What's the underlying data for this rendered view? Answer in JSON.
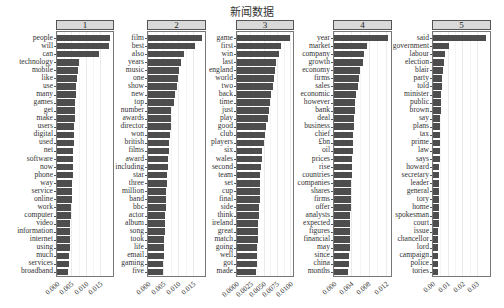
{
  "title": "新闻数据",
  "chart_data": {
    "type": "bar",
    "orientation": "horizontal",
    "title": "新闻数据",
    "xlabel": "",
    "ylabel": "",
    "facets": [
      {
        "label": "1",
        "xlim": [
          0,
          0.0195
        ],
        "ticks": [
          0,
          0.005,
          0.01,
          0.015
        ],
        "tick_labels": [
          "0.000",
          "0.005",
          "0.010",
          "0.015"
        ],
        "terms": [
          "people",
          "will",
          "can",
          "technology",
          "mobile",
          "like",
          "use",
          "many",
          "games",
          "get",
          "make",
          "users",
          "digital",
          "used",
          "net",
          "software",
          "now",
          "phone",
          "way",
          "service",
          "online",
          "work",
          "computer",
          "video",
          "information",
          "internet",
          "using",
          "much",
          "services",
          "broadband"
        ],
        "values": [
          0.0185,
          0.018,
          0.0146,
          0.0077,
          0.0073,
          0.007,
          0.0067,
          0.0066,
          0.0063,
          0.0062,
          0.0061,
          0.006,
          0.0059,
          0.0058,
          0.0057,
          0.0056,
          0.0055,
          0.0054,
          0.0053,
          0.0052,
          0.0051,
          0.0049,
          0.0048,
          0.0047,
          0.0046,
          0.0045,
          0.0044,
          0.0042,
          0.0041,
          0.004
        ]
      },
      {
        "label": "2",
        "xlim": [
          0,
          0.019
        ],
        "ticks": [
          0,
          0.005,
          0.01,
          0.015
        ],
        "tick_labels": [
          "0.000",
          "0.005",
          "0.010",
          "0.015"
        ],
        "terms": [
          "film",
          "best",
          "also",
          "years",
          "music",
          "one",
          "show",
          "new",
          "top",
          "number",
          "awards",
          "director",
          "won",
          "british",
          "films",
          "award",
          "including",
          "star",
          "three",
          "million",
          "band",
          "bbc",
          "actor",
          "album",
          "song",
          "took",
          "life",
          "email",
          "gaming",
          "five"
        ],
        "values": [
          0.018,
          0.0157,
          0.0121,
          0.0111,
          0.0103,
          0.0099,
          0.0097,
          0.0091,
          0.0087,
          0.0078,
          0.0077,
          0.0075,
          0.0072,
          0.0071,
          0.0069,
          0.0068,
          0.0066,
          0.0064,
          0.0063,
          0.0061,
          0.006,
          0.0059,
          0.0058,
          0.0056,
          0.0055,
          0.0054,
          0.0053,
          0.0052,
          0.0051,
          0.005
        ]
      },
      {
        "label": "3",
        "xlim": [
          0,
          0.0105
        ],
        "ticks": [
          0,
          0.0025,
          0.005,
          0.0075,
          0.01
        ],
        "tick_labels": [
          "0.0000",
          "0.0025",
          "0.0050",
          "0.0075",
          "0.0100"
        ],
        "terms": [
          "game",
          "first",
          "win",
          "last",
          "england",
          "world",
          "two",
          "back",
          "time",
          "just",
          "play",
          "good",
          "club",
          "players",
          "six",
          "wales",
          "second",
          "team",
          "set",
          "cup",
          "final",
          "side",
          "think",
          "ireland",
          "great",
          "match",
          "going",
          "well",
          "got",
          "made"
        ],
        "values": [
          0.01,
          0.0082,
          0.0078,
          0.0074,
          0.0072,
          0.007,
          0.0067,
          0.0063,
          0.0062,
          0.006,
          0.0058,
          0.0055,
          0.0052,
          0.0051,
          0.0047,
          0.0046,
          0.0045,
          0.0044,
          0.0044,
          0.0043,
          0.0043,
          0.0042,
          0.0041,
          0.004,
          0.0039,
          0.0039,
          0.0038,
          0.0038,
          0.0037,
          0.0036
        ]
      },
      {
        "label": "4",
        "xlim": [
          0,
          0.0132
        ],
        "ticks": [
          0,
          0.004,
          0.008,
          0.012
        ],
        "tick_labels": [
          "0.000",
          "0.004",
          "0.008",
          "0.012"
        ],
        "terms": [
          "year",
          "market",
          "company",
          "growth",
          "economy",
          "firms",
          "sales",
          "economic",
          "however",
          "bank",
          "deal",
          "business",
          "chief",
          "£bn",
          "oil",
          "prices",
          "rise",
          "countries",
          "companies",
          "shares",
          "firms",
          "offer",
          "analysts",
          "expected",
          "figures",
          "financial",
          "may",
          "since",
          "china",
          "months"
        ],
        "values": [
          0.0125,
          0.0077,
          0.007,
          0.0067,
          0.006,
          0.0058,
          0.0055,
          0.005,
          0.0049,
          0.0048,
          0.0047,
          0.0046,
          0.0045,
          0.0044,
          0.0043,
          0.0042,
          0.0041,
          0.0041,
          0.004,
          0.004,
          0.0039,
          0.0039,
          0.0038,
          0.0038,
          0.0037,
          0.0037,
          0.0036,
          0.0035,
          0.0034,
          0.0033
        ]
      },
      {
        "label": "5",
        "xlim": [
          0,
          0.039
        ],
        "ticks": [
          0,
          0.01,
          0.02,
          0.03
        ],
        "tick_labels": [
          "0.00",
          "0.01",
          "0.02",
          "0.03"
        ],
        "terms": [
          "said",
          "government",
          "labour",
          "election",
          "blair",
          "party",
          "told",
          "minister",
          "public",
          "brown",
          "say",
          "plans",
          "tax",
          "prime",
          "law",
          "says",
          "howard",
          "secretary",
          "leader",
          "general",
          "tory",
          "home",
          "spokesman",
          "court",
          "issue",
          "chancellor",
          "lord",
          "campaign",
          "police",
          "tories"
        ],
        "values": [
          0.036,
          0.011,
          0.0082,
          0.0076,
          0.0068,
          0.0064,
          0.0062,
          0.0058,
          0.0054,
          0.0052,
          0.005,
          0.0049,
          0.0048,
          0.0047,
          0.0046,
          0.0045,
          0.0044,
          0.0043,
          0.0042,
          0.0041,
          0.004,
          0.004,
          0.0039,
          0.0038,
          0.0037,
          0.0036,
          0.0035,
          0.0035,
          0.0034,
          0.0033
        ]
      }
    ],
    "bar_color": "#4d4d4d",
    "grid": true,
    "legend": "none"
  },
  "layout": {
    "panels": [
      {
        "left": 56,
        "width": 58
      },
      {
        "left": 147,
        "width": 59
      },
      {
        "left": 236,
        "width": 58
      },
      {
        "left": 333,
        "width": 59
      },
      {
        "left": 432,
        "width": 59
      }
    ]
  }
}
